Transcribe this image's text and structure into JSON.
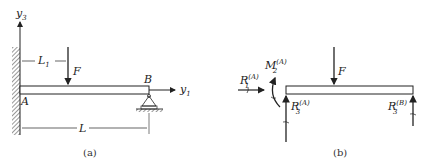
{
  "figure_a": {
    "caption": "(a)",
    "axis_vertical": {
      "base": "y",
      "sub": "3"
    },
    "axis_horizontal": {
      "base": "y",
      "sub": "1"
    },
    "point_A": "A",
    "point_B": "B",
    "force": "F",
    "dim_L1": {
      "base": "L",
      "sub": "1"
    },
    "dim_L": "L"
  },
  "figure_b": {
    "caption": "(b)",
    "force": "F",
    "R1A": {
      "base": "R",
      "sub": "1",
      "sup": "(A)"
    },
    "M2A": {
      "base": "M",
      "sub": "2",
      "sup": "(A)"
    },
    "R3A": {
      "base": "R",
      "sub": "3",
      "sup": "(A)"
    },
    "R3B": {
      "base": "R",
      "sub": "3",
      "sup": "(B)"
    }
  },
  "colors": {
    "ink": "#222222",
    "background": "#ffffff"
  }
}
